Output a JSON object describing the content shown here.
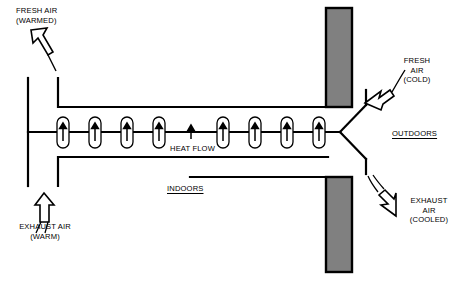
{
  "diagram": {
    "colors": {
      "line": "#000000",
      "wall_fill": "#808080",
      "wall_border": "#000000",
      "background": "#ffffff"
    },
    "labels": {
      "fresh_air_warmed": "FRESH AIR\n(WARMED)",
      "exhaust_air_warm": "EXHAUST AIR\n(WARM)",
      "fresh_air_cold": "FRESH\nAIR\n(COLD)",
      "exhaust_air_cooled": "EXHAUST\nAIR\n(COOLED)",
      "outdoors": "OUTDOORS",
      "indoors": "INDOORS",
      "heat_flow": "HEAT FLOW"
    },
    "icons": {
      "fresh_air_warmed_arrow": "hollow-arrow-up-left-icon",
      "exhaust_air_warm_arrow": "hollow-arrow-up-icon",
      "fresh_air_cold_arrow": "hollow-arrow-down-left-icon",
      "exhaust_air_cooled_arrow": "hollow-arrow-down-right-icon",
      "heat_flow_arrow": "arrow-up-icon"
    },
    "heat_flow_arrows": {
      "count_capsules": 8,
      "count_bare": 1,
      "capsule_x": [
        63,
        95,
        127,
        159,
        223,
        255,
        287,
        319
      ],
      "bare_x": [
        191
      ],
      "direction": "up"
    },
    "walls": [
      {
        "name": "upper-wall",
        "x": 326,
        "y": 8,
        "width": 26,
        "height": 99
      },
      {
        "name": "lower-wall",
        "x": 326,
        "y": 177,
        "width": 26,
        "height": 95
      }
    ]
  }
}
